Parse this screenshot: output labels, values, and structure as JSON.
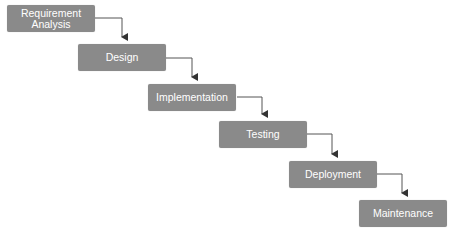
{
  "diagram": {
    "type": "waterfall",
    "colors": {
      "box_fill": "#8a8a8a",
      "box_text": "#ffffff",
      "connector": "#333333",
      "background": "#ffffff"
    },
    "stages": [
      {
        "label": "Requirement\nAnalysis"
      },
      {
        "label": "Design"
      },
      {
        "label": "Implementation"
      },
      {
        "label": "Testing"
      },
      {
        "label": "Deployment"
      },
      {
        "label": "Maintenance"
      }
    ],
    "edges": [
      {
        "from": "Requirement Analysis",
        "to": "Design"
      },
      {
        "from": "Design",
        "to": "Implementation"
      },
      {
        "from": "Implementation",
        "to": "Testing"
      },
      {
        "from": "Testing",
        "to": "Deployment"
      },
      {
        "from": "Deployment",
        "to": "Maintenance"
      }
    ]
  }
}
